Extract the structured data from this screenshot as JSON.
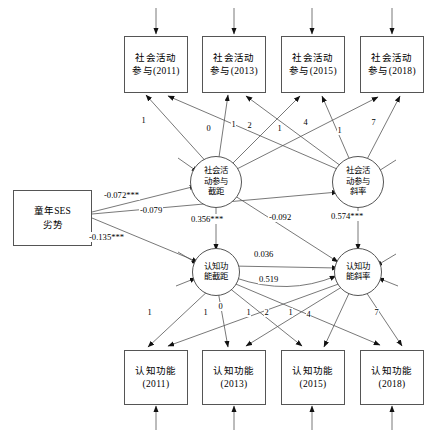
{
  "diagram": {
    "type": "sem-path-diagram",
    "stroke_color": "#555555",
    "text_color": "#000000",
    "background": "#ffffff"
  },
  "predictor": {
    "name": "childhood-ses-disadvantage",
    "line1": "童年SES",
    "line2": "劣势"
  },
  "observed_top": [
    {
      "line1": "社会活动",
      "line2": "参与(2011)",
      "year": "2011"
    },
    {
      "line1": "社会活动",
      "line2": "参与(2013)",
      "year": "2013"
    },
    {
      "line1": "社会活动",
      "line2": "参与(2015)",
      "year": "2015"
    },
    {
      "line1": "社会活动",
      "line2": "参与(2018)",
      "year": "2018"
    }
  ],
  "observed_bottom": [
    {
      "line1": "认知功能",
      "line2": "(2011)",
      "year": "2011"
    },
    {
      "line1": "认知功能",
      "line2": "(2013)",
      "year": "2013"
    },
    {
      "line1": "认知功能",
      "line2": "(2015)",
      "year": "2015"
    },
    {
      "line1": "认知功能",
      "line2": "(2018)",
      "year": "2018"
    }
  ],
  "latents": {
    "social_intercept": {
      "l1": "社会活",
      "l2": "动参与",
      "l3": "截距"
    },
    "social_slope": {
      "l1": "社会活",
      "l2": "动参与",
      "l3": "斜率"
    },
    "cog_intercept": {
      "l1": "认知功",
      "l2": "能截距"
    },
    "cog_slope": {
      "l1": "认知功",
      "l2": "能斜率"
    }
  },
  "loadings": {
    "social_intercept": [
      "1",
      "1",
      "1",
      "1"
    ],
    "social_slope": [
      "0",
      "2",
      "4",
      "7"
    ],
    "cog_intercept": [
      "1",
      "1",
      "1",
      "1"
    ],
    "cog_slope": [
      "0",
      "2",
      "4",
      "7"
    ]
  },
  "paths": [
    {
      "name": "ses-to-social-intercept",
      "label": "-0.072***",
      "value": -0.072,
      "sig": "***"
    },
    {
      "name": "ses-to-social-slope",
      "label": "-0.079",
      "value": -0.079,
      "sig": ""
    },
    {
      "name": "ses-to-cog-intercept",
      "label": "-0.135***",
      "value": -0.135,
      "sig": "***"
    },
    {
      "name": "social-intercept-to-cog-intercept",
      "label": "0.356***",
      "value": 0.356,
      "sig": "***"
    },
    {
      "name": "social-intercept-to-cog-slope",
      "label": "-0.092",
      "value": -0.092,
      "sig": ""
    },
    {
      "name": "social-slope-to-cog-slope",
      "label": "0.574***",
      "value": 0.574,
      "sig": "***"
    },
    {
      "name": "cog-intercept-to-cog-slope-a",
      "label": "0.036",
      "value": 0.036,
      "sig": ""
    },
    {
      "name": "cog-intercept-to-cog-slope-b",
      "label": "0.519",
      "value": 0.519,
      "sig": ""
    }
  ]
}
